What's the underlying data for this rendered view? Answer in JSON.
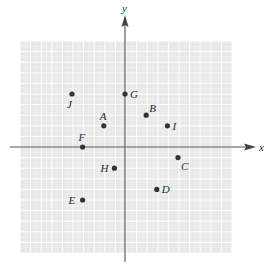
{
  "figure": {
    "type": "coordinate-plane",
    "x_axis_label": "x",
    "y_axis_label": "y",
    "x_range": [
      -10,
      10
    ],
    "y_range": [
      -10,
      10
    ],
    "grid": true,
    "colors": {
      "grid_background": "#e8e8e8",
      "grid_minor": "#f3f3f3",
      "grid_major": "#ffffff",
      "axis": "#555555",
      "point": "#333333",
      "label": "#2a2a2a"
    }
  },
  "points": [
    {
      "label": "A",
      "x": -2,
      "y": 2,
      "label_pos": "above"
    },
    {
      "label": "B",
      "x": 2,
      "y": 3,
      "label_pos": "upper-right"
    },
    {
      "label": "C",
      "x": 5,
      "y": -1,
      "label_pos": "lower-right"
    },
    {
      "label": "D",
      "x": 3,
      "y": -4,
      "label_pos": "right"
    },
    {
      "label": "E",
      "x": -4,
      "y": -5,
      "label_pos": "left"
    },
    {
      "label": "F",
      "x": -4,
      "y": 0,
      "label_pos": "above"
    },
    {
      "label": "G",
      "x": 0,
      "y": 5,
      "label_pos": "right"
    },
    {
      "label": "H",
      "x": -1,
      "y": -2,
      "label_pos": "left"
    },
    {
      "label": "I",
      "x": 4,
      "y": 2,
      "label_pos": "right"
    },
    {
      "label": "J",
      "x": -5,
      "y": 5,
      "label_pos": "below"
    }
  ]
}
